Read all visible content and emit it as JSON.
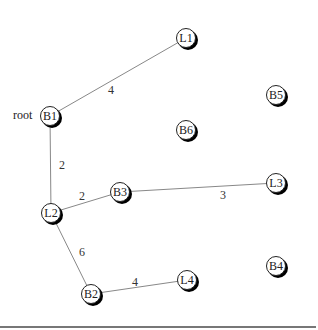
{
  "diagram": {
    "root_label": "root",
    "nodes": [
      {
        "id": "B1",
        "label": "B1",
        "x": 50,
        "y": 116
      },
      {
        "id": "L1",
        "label": "L1",
        "x": 186,
        "y": 38
      },
      {
        "id": "B5",
        "label": "B5",
        "x": 276,
        "y": 95
      },
      {
        "id": "B6",
        "label": "B6",
        "x": 186,
        "y": 130
      },
      {
        "id": "L2",
        "label": "L2",
        "x": 51,
        "y": 213
      },
      {
        "id": "B3",
        "label": "B3",
        "x": 120,
        "y": 192
      },
      {
        "id": "L3",
        "label": "L3",
        "x": 276,
        "y": 183
      },
      {
        "id": "B4",
        "label": "B4",
        "x": 276,
        "y": 266
      },
      {
        "id": "B2",
        "label": "B2",
        "x": 91,
        "y": 294
      },
      {
        "id": "L4",
        "label": "L4",
        "x": 187,
        "y": 280
      }
    ],
    "edges": [
      {
        "from": "B1",
        "to": "L1",
        "weight": "4",
        "lx": 111,
        "ly": 90
      },
      {
        "from": "B1",
        "to": "L2",
        "weight": "2",
        "lx": 62,
        "ly": 165
      },
      {
        "from": "L2",
        "to": "B3",
        "weight": "2",
        "lx": 82,
        "ly": 196
      },
      {
        "from": "B3",
        "to": "L3",
        "weight": "3",
        "lx": 223,
        "ly": 195
      },
      {
        "from": "L2",
        "to": "B2",
        "weight": "6",
        "lx": 82,
        "ly": 252
      },
      {
        "from": "B2",
        "to": "L4",
        "weight": "4",
        "lx": 135,
        "ly": 282
      }
    ],
    "colors": {
      "edge": "#888888",
      "node_border": "#222222",
      "shadow": "#000000"
    }
  }
}
